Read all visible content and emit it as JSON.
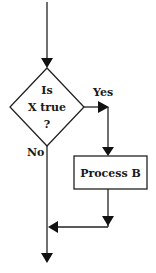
{
  "diagram": {
    "type": "flowchart",
    "decision": {
      "line1": "Is",
      "line2": "X true",
      "line3": "?"
    },
    "branches": {
      "yes_label": "Yes",
      "no_label": "No"
    },
    "process": {
      "label": "Process B"
    },
    "colors": {
      "line": "#222222",
      "background": "#ffffff"
    }
  }
}
